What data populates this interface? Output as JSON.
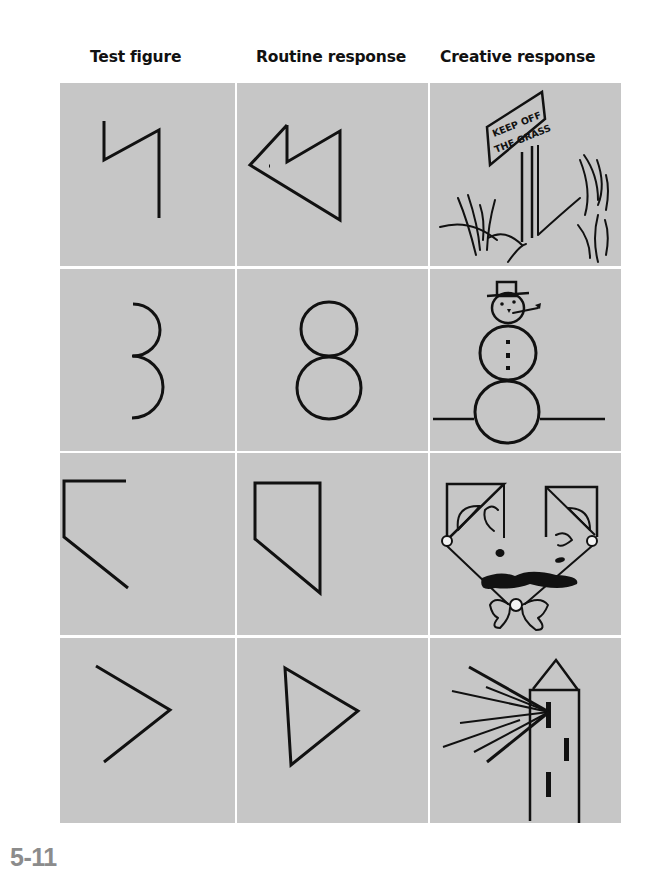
{
  "headers": {
    "test": "Test figure",
    "routine": "Routine response",
    "creative": "Creative response"
  },
  "figure_label": "5-11",
  "colors": {
    "cell_bg": "#c6c6c6",
    "stroke": "#111111",
    "label": "#8c8c8c"
  },
  "rows": [
    {
      "test": "zigzag-line",
      "routine": "zigzag-arrow-triangle",
      "creative": "keep-off-the-grass-sign",
      "creative_text": [
        "KEEP OFF",
        "THE GRASS"
      ]
    },
    {
      "test": "two-semicircles",
      "routine": "figure-eight",
      "creative": "snowman"
    },
    {
      "test": "open-bracket-shape",
      "routine": "closed-pentagon",
      "creative": "mustached-face-with-bowtie"
    },
    {
      "test": "angle-bracket",
      "routine": "triangle",
      "creative": "lighthouse-with-beams"
    }
  ]
}
